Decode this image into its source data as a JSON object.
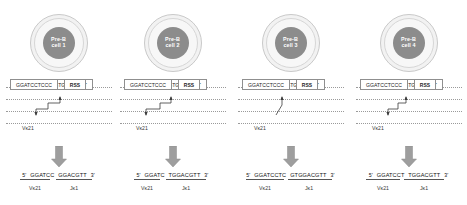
{
  "figure": {
    "background": "#ffffff",
    "rss_fill": "#c2c2c2",
    "nucleus_fill": "#8c8c8c",
    "arrow_fill": "#9e9e9e",
    "strand_color": "#9a9a9a"
  },
  "labels": {
    "rss": "RSS",
    "jk": "Jκ1",
    "vk": "Vκ21",
    "five_prime": "5'",
    "three_prime": "3'",
    "top_sequence": "GTGGACGTT",
    "bottom_sequence": "GGATCCTCCC"
  },
  "panels": [
    {
      "cell_line1": "Pre-B",
      "cell_line2": "cell 1",
      "top_sequence": "GTGGACGTT",
      "bottom_sequence": "GGATCCTCCC",
      "jk_label": "Jκ1",
      "vk_label": "Vκ21",
      "rss_label": "RSS",
      "product_five": "5'",
      "product_v": "GGATCC",
      "product_j": "GGACGTT",
      "product_three": "3'",
      "product_v_label": "Vκ21",
      "product_j_label": "Jκ1",
      "junction_style": "stepped"
    },
    {
      "cell_line1": "Pre-B",
      "cell_line2": "cell 2",
      "top_sequence": "GTGGACGTT",
      "bottom_sequence": "GGATCCTCCC",
      "jk_label": "Jκ1",
      "vk_label": "Vκ21",
      "rss_label": "RSS",
      "product_five": "5'",
      "product_v": "GGATC",
      "product_j": "TGGACGTT",
      "product_three": "3'",
      "product_v_label": "Vκ21",
      "product_j_label": "Jκ1",
      "junction_style": "stepped"
    },
    {
      "cell_line1": "Pre-B",
      "cell_line2": "cell 3",
      "top_sequence": "GTGGACGTT",
      "bottom_sequence": "GGATCCTCCC",
      "jk_label": "Jκ1",
      "vk_label": "Vκ21",
      "rss_label": "RSS",
      "product_five": "5'",
      "product_v": "GGATCCTC",
      "product_j": "GTGGACGTT",
      "product_three": "3'",
      "product_v_label": "Vκ21",
      "product_j_label": "Jκ1",
      "junction_style": "diagonal"
    },
    {
      "cell_line1": "Pre-B",
      "cell_line2": "cell 4",
      "top_sequence": "GTGGACGTT",
      "bottom_sequence": "GGATCCTCCC",
      "jk_label": "Jκ1",
      "vk_label": "Vκ21",
      "rss_label": "RSS",
      "product_five": "5'",
      "product_v": "GGATCCT",
      "product_j": "TGGACGTT",
      "product_three": "3'",
      "product_v_label": "Vκ21",
      "product_j_label": "Jκ1",
      "junction_style": "stepped"
    }
  ]
}
